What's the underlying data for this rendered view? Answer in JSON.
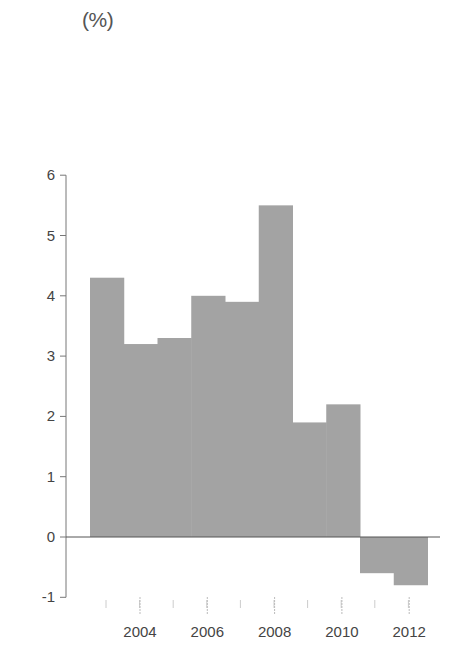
{
  "chart_data": {
    "type": "bar",
    "title": "",
    "unit_label": "(%)",
    "xlabel": "",
    "ylabel": "(%)",
    "categories": [
      "2003",
      "2004",
      "2005",
      "2006",
      "2007",
      "2008",
      "2009",
      "2010",
      "2011",
      "2012"
    ],
    "values": [
      4.3,
      3.2,
      3.3,
      4.0,
      3.9,
      5.5,
      1.9,
      2.2,
      -0.6,
      -0.8
    ],
    "ylim": [
      -1,
      6
    ],
    "yticks": [
      -1,
      0,
      1,
      2,
      3,
      4,
      5,
      6
    ],
    "xtick_labels": [
      "2004",
      "2006",
      "2008",
      "2010",
      "2012"
    ],
    "grid": false,
    "legend": null,
    "bar_color": "#a3a3a3",
    "bar_gap": 0
  }
}
